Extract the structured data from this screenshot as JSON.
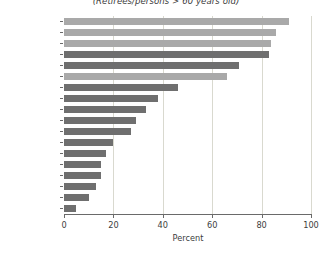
{
  "chart_data": {
    "type": "bar",
    "orientation": "horizontal",
    "title": "(Retirees/persons > 60 years old)",
    "xlabel": "Percent",
    "ylabel": "",
    "xlim": [
      0,
      100
    ],
    "xticks": [
      0,
      20,
      40,
      60,
      80,
      100
    ],
    "grid": true,
    "grid_axis": "x",
    "legend": null,
    "categories": [
      "Germany",
      "England",
      "United States",
      "Uruguay",
      "Argentina",
      "Japan",
      "Brazil",
      "Costa Rica",
      "Panama",
      "Venezuela",
      "Jamaica",
      "Ecuador",
      "Nicaragua",
      "Bolivia",
      "Peru",
      "Guatemala",
      "Colombia",
      "El Salvador"
    ],
    "values": [
      91,
      86,
      84,
      83,
      71,
      66,
      46,
      38,
      33,
      29,
      27,
      20,
      17,
      15,
      15,
      13,
      10,
      5
    ],
    "bar_shades": [
      "light",
      "light",
      "light",
      "dark",
      "dark",
      "light",
      "dark",
      "dark",
      "dark",
      "dark",
      "dark",
      "dark",
      "dark",
      "dark",
      "dark",
      "dark",
      "dark",
      "dark"
    ],
    "colors": {
      "bar_light": "#a9a9a9",
      "bar_dark": "#6f6f6f",
      "grid": "#d9d9cf",
      "axis": "#6a6a6a",
      "text": "#3d3d3d",
      "background": "#ffffff"
    }
  }
}
